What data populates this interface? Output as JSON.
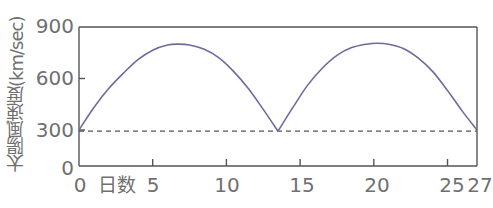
{
  "chart_data": {
    "type": "line",
    "title": "",
    "xlabel": "日数",
    "ylabel": "太陽風速度(km/sec)",
    "x_ticks": [
      "0",
      "5",
      "10",
      "15",
      "20",
      "25",
      "27"
    ],
    "y_ticks": [
      "0",
      "300",
      "600",
      "900"
    ],
    "xlim": [
      0,
      27
    ],
    "ylim": [
      0,
      900
    ],
    "y_axis_note": "scale between 0 and 300 is compressed",
    "grid": false,
    "legend": null,
    "series": [
      {
        "name": "太陽風速度",
        "style": "solid",
        "color": "#6f6a9e",
        "x": [
          0,
          1,
          2,
          3,
          4,
          5,
          6,
          6.75,
          7.5,
          8.5,
          9.5,
          10.5,
          11.5,
          12.5,
          13.5,
          14.5,
          15.5,
          16.5,
          17.5,
          18.5,
          19.5,
          20.25,
          21,
          22,
          23,
          24,
          25,
          26,
          27
        ],
        "y": [
          300,
          430,
          540,
          630,
          710,
          765,
          795,
          800,
          795,
          770,
          720,
          640,
          540,
          420,
          290,
          430,
          560,
          660,
          735,
          780,
          800,
          805,
          800,
          775,
          720,
          640,
          530,
          410,
          300
        ]
      },
      {
        "name": "基準線",
        "style": "dashed",
        "color": "#555555",
        "x": [
          0,
          27
        ],
        "y": [
          290,
          290
        ]
      }
    ]
  },
  "labels": {
    "ylabel": "太陽風速度(km/sec)",
    "xlabel": "日数",
    "y_ticks": {
      "t900": "900",
      "t600": "600",
      "t300": "300",
      "t0": "0"
    },
    "x_ticks": {
      "t0": "0",
      "t5": "5",
      "t10": "10",
      "t15": "15",
      "t20": "20",
      "t25": "25",
      "t27": "27"
    }
  }
}
